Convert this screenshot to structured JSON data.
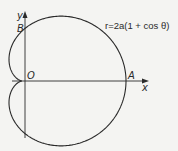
{
  "diagram": {
    "type": "polar-curve",
    "equation": "r=2a(1 + cos θ)",
    "curve_name": "cardioid",
    "labels": {
      "y_axis": "y",
      "x_axis": "x",
      "origin": "O",
      "point_a": "A",
      "point_b": "B"
    },
    "colors": {
      "background": "#f4f4f2",
      "stroke": "#2a2a2a"
    }
  }
}
